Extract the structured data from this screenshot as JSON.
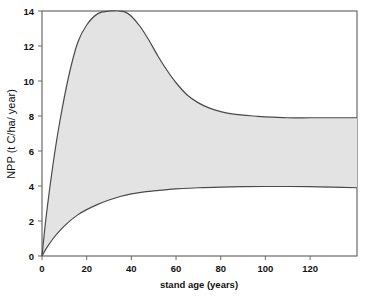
{
  "chart_data": {
    "type": "area",
    "title": "",
    "xlabel": "stand age (years)",
    "ylabel": "NPP (t C/ha/ year)",
    "xlim": [
      0,
      141
    ],
    "ylim": [
      0,
      14
    ],
    "xticks": [
      0,
      20,
      40,
      60,
      80,
      100,
      120
    ],
    "xtick_labels": [
      "0",
      "20",
      "40",
      "60",
      "80",
      "100",
      "120"
    ],
    "yticks": [
      0,
      2,
      4,
      6,
      8,
      10,
      12,
      14
    ],
    "ytick_labels": [
      "0",
      "2",
      "4",
      "6",
      "8",
      "10",
      "12",
      "14"
    ],
    "grid": false,
    "legend": "none",
    "fill_color": "#e3e3e3",
    "line_color": "#4a4a4a",
    "series": [
      {
        "name": "upper NPP bound",
        "x": [
          0,
          2,
          5,
          8,
          12,
          16,
          20,
          25,
          30,
          34,
          37,
          40,
          44,
          48,
          52,
          56,
          60,
          65,
          70,
          75,
          80,
          85,
          90,
          95,
          100,
          110,
          120,
          130,
          141
        ],
        "values": [
          0,
          2.4,
          5.3,
          7.7,
          10.3,
          12.2,
          13.2,
          13.85,
          13.99,
          14.0,
          13.95,
          13.7,
          13.1,
          12.3,
          11.4,
          10.6,
          9.9,
          9.2,
          8.75,
          8.45,
          8.25,
          8.12,
          8.05,
          8.0,
          7.95,
          7.9,
          7.9,
          7.9,
          7.9
        ]
      },
      {
        "name": "lower NPP bound",
        "x": [
          0,
          2,
          5,
          8,
          12,
          16,
          20,
          25,
          30,
          35,
          40,
          45,
          50,
          55,
          60,
          70,
          80,
          90,
          100,
          110,
          120,
          130,
          141
        ],
        "values": [
          0,
          0.45,
          1.0,
          1.45,
          1.95,
          2.35,
          2.65,
          2.95,
          3.2,
          3.4,
          3.55,
          3.65,
          3.72,
          3.78,
          3.83,
          3.9,
          3.94,
          3.96,
          3.97,
          3.97,
          3.96,
          3.93,
          3.9
        ]
      }
    ],
    "shaded_band": {
      "description": "range of NPP between lower and upper bound across stand age",
      "upper_plateau": 7.9,
      "lower_plateau": 3.95,
      "peak_value": 14.0,
      "peak_age": 37
    }
  },
  "axes": {
    "plot_left_px": 42,
    "plot_right_px": 357,
    "plot_top_px": 11,
    "plot_bottom_px": 256
  }
}
